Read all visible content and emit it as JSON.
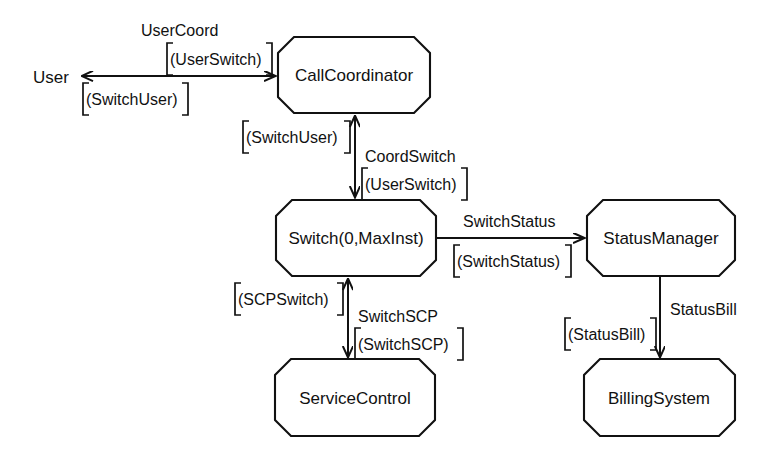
{
  "diagram": {
    "background_color": "#ffffff",
    "line_color": "#111111",
    "nodes": [
      {
        "id": "call-coordinator",
        "label": "CallCoordinator",
        "shape": "octagon",
        "x": 278,
        "y": 37,
        "w": 152,
        "h": 76
      },
      {
        "id": "switch",
        "label": "Switch(0,MaxInst)",
        "shape": "octagon",
        "x": 276,
        "y": 200,
        "w": 160,
        "h": 76
      },
      {
        "id": "status-manager",
        "label": "StatusManager",
        "shape": "octagon",
        "x": 587,
        "y": 200,
        "w": 148,
        "h": 76
      },
      {
        "id": "service-control",
        "label": "ServiceControl",
        "shape": "octagon",
        "x": 275,
        "y": 359,
        "w": 160,
        "h": 77
      },
      {
        "id": "billing-system",
        "label": "BillingSystem",
        "shape": "octagon",
        "x": 584,
        "y": 359,
        "w": 151,
        "h": 77
      }
    ],
    "actors": [
      {
        "id": "user",
        "label": "User",
        "x": 33,
        "y": 77
      }
    ],
    "edges": [
      {
        "id": "user-callcoordinator",
        "from": "user",
        "to": "call-coordinator",
        "direction": "bidirectional",
        "orientation": "horizontal",
        "label_above": "UserCoord",
        "sublabel_above": "(UserSwitch)",
        "sublabel_below": "(SwitchUser)"
      },
      {
        "id": "callcoordinator-switch",
        "from": "call-coordinator",
        "to": "switch",
        "direction": "bidirectional",
        "orientation": "vertical",
        "label_right": "CoordSwitch",
        "sublabel_right": "(UserSwitch)",
        "sublabel_left": "(SwitchUser)"
      },
      {
        "id": "switch-statusmanager",
        "from": "switch",
        "to": "status-manager",
        "direction": "forward",
        "orientation": "horizontal",
        "label_above": "SwitchStatus",
        "sublabel_below": "(SwitchStatus)"
      },
      {
        "id": "switch-servicecontrol",
        "from": "switch",
        "to": "service-control",
        "direction": "bidirectional",
        "orientation": "vertical",
        "label_right": "SwitchSCP",
        "sublabel_right": "(SwitchSCP)",
        "sublabel_left": "(SCPSwitch)"
      },
      {
        "id": "statusmanager-billingsystem",
        "from": "status-manager",
        "to": "billing-system",
        "direction": "forward",
        "orientation": "vertical",
        "label_right": "StatusBill",
        "sublabel_left": "(StatusBill)"
      }
    ],
    "labels": {
      "user": "User",
      "call_coordinator": "CallCoordinator",
      "switch": "Switch(0,MaxInst)",
      "status_manager": "StatusManager",
      "service_control": "ServiceControl",
      "billing_system": "BillingSystem",
      "user_coord": "UserCoord",
      "user_switch_1": "(UserSwitch)",
      "switch_user_1": "(SwitchUser)",
      "coord_switch": "CoordSwitch",
      "user_switch_2": "(UserSwitch)",
      "switch_user_2": "(SwitchUser)",
      "switch_status": "SwitchStatus",
      "switch_status_msg": "(SwitchStatus)",
      "switch_scp": "SwitchSCP",
      "switch_scp_msg": "(SwitchSCP)",
      "scp_switch_msg": "(SCPSwitch)",
      "status_bill": "StatusBill",
      "status_bill_msg": "(StatusBill)"
    }
  }
}
